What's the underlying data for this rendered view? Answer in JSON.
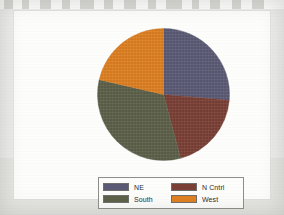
{
  "chart_data": {
    "type": "pie",
    "title": "",
    "categories": [
      "NE",
      "N Cntrl",
      "South",
      "West"
    ],
    "values": [
      26,
      19,
      33,
      22
    ],
    "unit": "percent",
    "start_angle_deg": 0,
    "direction": "clockwise",
    "slices": [
      {
        "label": "NE",
        "value": 26,
        "color": "#5a5a75",
        "start_deg": 0,
        "end_deg": 95
      },
      {
        "label": "N Cntrl",
        "value": 19,
        "color": "#7a3f35",
        "start_deg": 95,
        "end_deg": 165
      },
      {
        "label": "South",
        "value": 33,
        "color": "#5c6048",
        "start_deg": 165,
        "end_deg": 283
      },
      {
        "label": "West",
        "value": 22,
        "color": "#e08020",
        "start_deg": 283,
        "end_deg": 360
      }
    ],
    "legend": {
      "position": "bottom",
      "columns": 2,
      "entries": [
        {
          "label": "NE",
          "color": "#5a5a75"
        },
        {
          "label": "N Cntrl",
          "color": "#7a3f35"
        },
        {
          "label": "South",
          "color": "#5c6048"
        },
        {
          "label": "West",
          "color": "#e08020"
        }
      ]
    },
    "xlabel": "",
    "ylabel": "",
    "grid": false,
    "data_labels_shown": false
  },
  "colors": {
    "ne": "#5a5a75",
    "n_cntrl": "#7a3f35",
    "south": "#5c6048",
    "west": "#e08020",
    "card_background": "#fdfdfc",
    "page_background": "#ececea",
    "legend_border": "#8e8e8a"
  }
}
